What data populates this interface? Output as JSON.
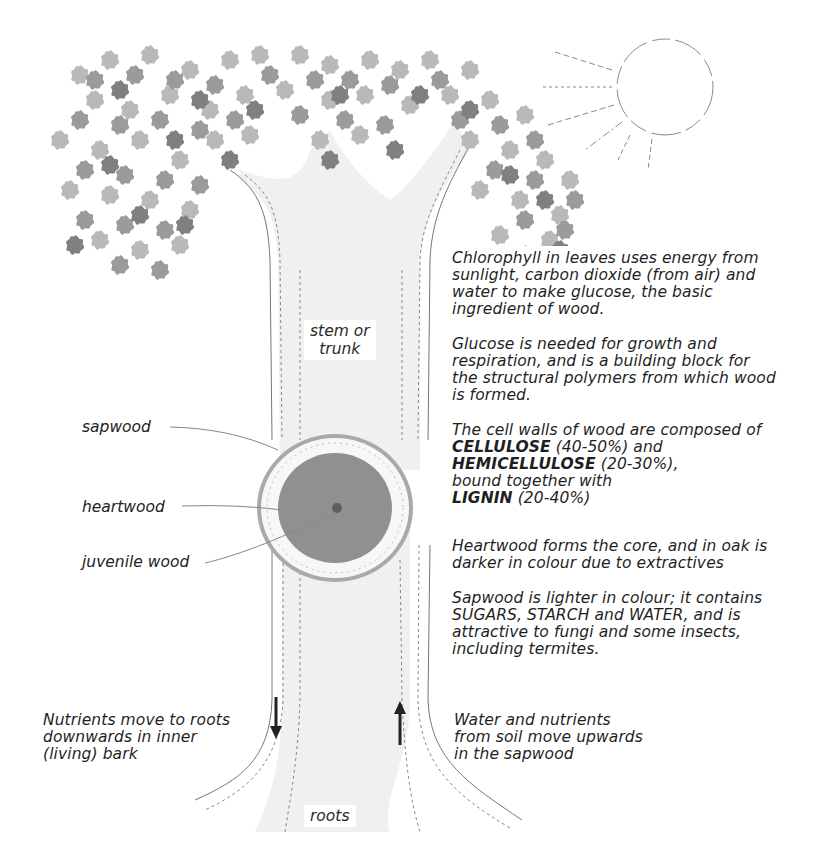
{
  "diagram": {
    "colors": {
      "leaf_light": "#b8b8b8",
      "leaf_mid": "#9a9a9a",
      "leaf_dark": "#7e7e7e",
      "trunk_fill": "#efefef",
      "heartwood": "#8f8f8f",
      "sapwood": "#f7f7f7",
      "bark": "#a8a8a8",
      "arrow": "#222222",
      "text": "#1f1f1f"
    }
  },
  "labels": {
    "stem": "stem or\ntrunk",
    "roots": "roots",
    "sapwood": "sapwood",
    "heartwood": "heartwood",
    "juvenile_wood": "juvenile wood"
  },
  "notes": {
    "chlorophyll": "Chlorophyll in leaves uses energy from\nsunlight, carbon dioxide (from air) and\nwater to make glucose, the basic\ningredient of wood.",
    "glucose": "Glucose is needed for growth and\nrespiration, and is a building block for\nthe structural polymers from which wood\nis formed.",
    "cell_walls": {
      "intro": "The cell walls of wood are composed of",
      "cellulose": "CELLULOSE",
      "cellulose_pct": " (40-50%) and",
      "hemicellulose": "HEMICELLULOSE",
      "hemicellulose_pct": " (20-30%),",
      "bound": "bound together with",
      "lignin": "LIGNIN",
      "lignin_pct": " (20-40%)"
    },
    "heartwood": "Heartwood forms the core, and in oak is\ndarker in colour due to extractives",
    "sapwood": "Sapwood is lighter in colour; it contains\nSUGARS, STARCH and WATER, and is\nattractive to fungi and some insects,\nincluding termites.",
    "nutrients_down": "Nutrients move  to roots\ndownwards in inner\n(living) bark",
    "water_up": "Water and nutrients\nfrom soil move upwards\nin the sapwood"
  }
}
